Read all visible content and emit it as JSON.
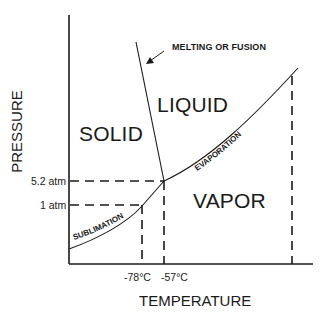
{
  "diagram": {
    "title": "",
    "type": "phase diagram",
    "axes": {
      "x_label": "TEMPERATURE",
      "y_label": "PRESSURE"
    },
    "regions": {
      "solid": "SOLID",
      "liquid": "LIQUID",
      "vapor": "VAPOR"
    },
    "curves": {
      "melting": "MELTING OR FUSION",
      "evaporation": "EVAPORATION",
      "sublimation": "SUBLIMATION"
    },
    "pressure_ticks": [
      "5.2 atm",
      "1 atm"
    ],
    "temperature_ticks": [
      "-78°C",
      "-57°C"
    ],
    "colors": {
      "line": "#1a1a1a",
      "background": "#ffffff"
    }
  }
}
